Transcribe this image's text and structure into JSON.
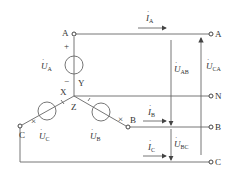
{
  "diagram": {
    "colors": {
      "line": "#555555",
      "text": "#333333",
      "background": "#ffffff"
    },
    "nodes": {
      "left": [
        {
          "id": "A_src",
          "label": "A"
        },
        {
          "id": "C_src",
          "label": "C"
        },
        {
          "id": "B_src",
          "label": "B"
        },
        {
          "id": "neutral",
          "labels": [
            "X",
            "Y",
            "Z"
          ]
        }
      ],
      "right": [
        {
          "id": "A_out",
          "label": "A"
        },
        {
          "id": "N_out",
          "label": "N"
        },
        {
          "id": "B_out",
          "label": "B"
        },
        {
          "id": "C_out",
          "label": "C"
        }
      ]
    },
    "sources": [
      {
        "id": "UA",
        "sym": "U",
        "sub": "A",
        "plus": "+",
        "minus": "−"
      },
      {
        "id": "UB",
        "sym": "U",
        "sub": "B"
      },
      {
        "id": "UC",
        "sym": "U",
        "sub": "C"
      }
    ],
    "currents": [
      {
        "id": "IA",
        "sym": "I",
        "sub": "A"
      },
      {
        "id": "IB",
        "sym": "I",
        "sub": "B"
      },
      {
        "id": "IC",
        "sym": "I",
        "sub": "C"
      }
    ],
    "line_voltages": [
      {
        "id": "UAB",
        "sym": "U",
        "sub": "AB"
      },
      {
        "id": "UBC",
        "sym": "U",
        "sub": "BC"
      },
      {
        "id": "UCA",
        "sym": "U",
        "sub": "CA"
      }
    ],
    "polarity_marks": {
      "dot_mark": "×",
      "tick_mark": "/"
    }
  }
}
